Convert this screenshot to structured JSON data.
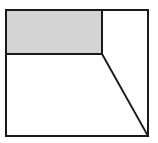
{
  "diagram": {
    "type": "geometric-figure",
    "canvas": {
      "width": 158,
      "height": 143,
      "background": "#ffffff"
    },
    "stroke_color": "#1a1a1a",
    "stroke_width": 2,
    "outer_rectangle": {
      "x1": 6,
      "y1": 10,
      "x2": 148,
      "y2": 136
    },
    "shaded_rectangle": {
      "x1": 6,
      "y1": 10,
      "x2": 102,
      "y2": 54,
      "fill": "#d4d4d4"
    },
    "segments": [
      {
        "name": "horizontal-divider",
        "x1": 6,
        "y1": 54,
        "x2": 102,
        "y2": 54
      },
      {
        "name": "vertical-divider",
        "x1": 102,
        "y1": 10,
        "x2": 102,
        "y2": 54
      },
      {
        "name": "diagonal-line",
        "x1": 102,
        "y1": 54,
        "x2": 148,
        "y2": 136
      }
    ],
    "regions": [
      {
        "name": "shaded-top-left-rectangle",
        "shaded": true
      },
      {
        "name": "top-right-trapezoid",
        "shaded": false
      },
      {
        "name": "bottom-trapezoid",
        "shaded": false
      }
    ]
  }
}
